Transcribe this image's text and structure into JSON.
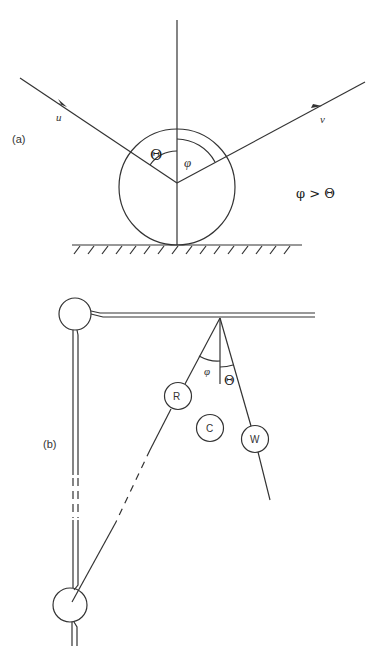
{
  "figure": {
    "stroke_color": "#333333",
    "background": "#ffffff"
  },
  "panel_a": {
    "label": "(a)",
    "incoming_vector_label": "u",
    "outgoing_vector_label": "v",
    "angle_left_label": "Θ",
    "angle_right_label": "φ",
    "relation": "φ > Θ"
  },
  "panel_b": {
    "label": "(b)",
    "ball_r_label": "R",
    "ball_c_label": "C",
    "ball_w_label": "W",
    "angle_phi_label": "φ",
    "angle_theta_label": "Θ"
  }
}
